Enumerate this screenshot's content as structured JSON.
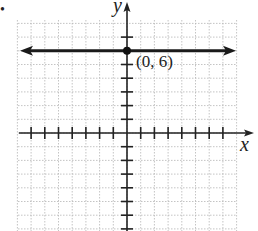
{
  "chart_data": {
    "type": "line",
    "title": "",
    "xlabel": "x",
    "ylabel": "y",
    "xlim": [
      -8,
      8
    ],
    "ylim": [
      -7,
      8
    ],
    "grid": true,
    "x_ticks": [
      -7,
      -6,
      -5,
      -4,
      -3,
      -2,
      -1,
      1,
      2,
      3,
      4,
      5,
      6,
      7
    ],
    "y_ticks": [
      -7,
      -6,
      -5,
      -4,
      -3,
      -2,
      -1,
      1,
      2,
      3,
      4,
      5,
      6,
      7
    ],
    "series": [
      {
        "name": "y = 6",
        "kind": "horizontal line with arrows",
        "x": [
          -8,
          8
        ],
        "y": [
          6,
          6
        ]
      }
    ],
    "points": [
      {
        "x": 0,
        "y": 6,
        "label": "(0, 6)"
      }
    ],
    "annotations": [
      "(0, 6)"
    ]
  },
  "labels": {
    "x_axis": "x",
    "y_axis": "y",
    "point": "(0, 6)",
    "bullet": "•"
  }
}
